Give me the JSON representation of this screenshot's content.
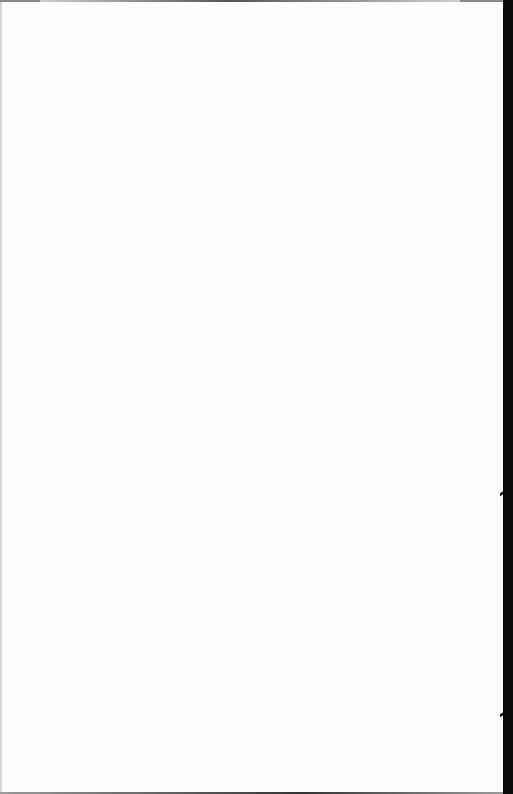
{
  "document": {
    "type": "scanned-page",
    "content": "",
    "state": "blank"
  },
  "colors": {
    "paper": "#fdfdfd",
    "scanner_edge": "#0b0b0b",
    "edge_line": "#555555"
  }
}
